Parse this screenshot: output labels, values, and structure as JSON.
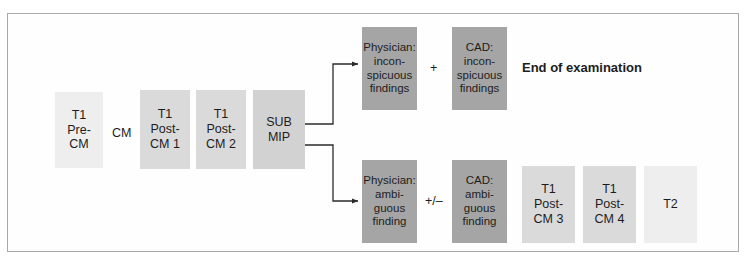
{
  "diagram": {
    "title_text": "",
    "colors": {
      "frame_border": "#a9a9ab",
      "background": "#ffffff",
      "box_lightest": "#eeeeee",
      "box_light": "#dadada",
      "box_mid": "#d2d2d2",
      "box_dark": "#a5a5a5",
      "text": "#1d1d1d",
      "connector": "#2b2b2b"
    },
    "sequence_boxes": [
      {
        "id": "t1-pre-cm",
        "lines": [
          "T1",
          "Pre-",
          "CM"
        ],
        "shade": "lightest"
      },
      {
        "id": "t1-post-cm-1",
        "lines": [
          "T1",
          "Post-",
          "CM 1"
        ],
        "shade": "light"
      },
      {
        "id": "t1-post-cm-2",
        "lines": [
          "T1",
          "Post-",
          "CM 2"
        ],
        "shade": "light"
      },
      {
        "id": "sub-mip",
        "lines": [
          "SUB",
          "MIP"
        ],
        "shade": "mid"
      }
    ],
    "cm_label": "CM",
    "upper_branch": {
      "physician_box": {
        "id": "physician-inconspicuous",
        "lines": [
          "Physician:",
          "incon-",
          "spicuous",
          "findings"
        ],
        "shade": "dark"
      },
      "operator": "+",
      "cad_box": {
        "id": "cad-inconspicuous",
        "lines": [
          "CAD:",
          "incon-",
          "spicuous",
          "findings"
        ],
        "shade": "dark"
      },
      "outcome_text": "End of examination"
    },
    "lower_branch": {
      "physician_box": {
        "id": "physician-ambiguous",
        "lines": [
          "Physician:",
          "ambi-",
          "guous",
          "finding"
        ],
        "shade": "dark"
      },
      "operator": "+/–",
      "cad_box": {
        "id": "cad-ambiguous",
        "lines": [
          "CAD:",
          "ambi-",
          "guous",
          "finding"
        ],
        "shade": "dark"
      },
      "followup_boxes": [
        {
          "id": "t1-post-cm-3",
          "lines": [
            "T1",
            "Post-",
            "CM 3"
          ],
          "shade": "light"
        },
        {
          "id": "t1-post-cm-4",
          "lines": [
            "T1",
            "Post-",
            "CM 4"
          ],
          "shade": "light"
        },
        {
          "id": "t2",
          "lines": [
            "T2"
          ],
          "shade": "lightest"
        }
      ]
    }
  }
}
